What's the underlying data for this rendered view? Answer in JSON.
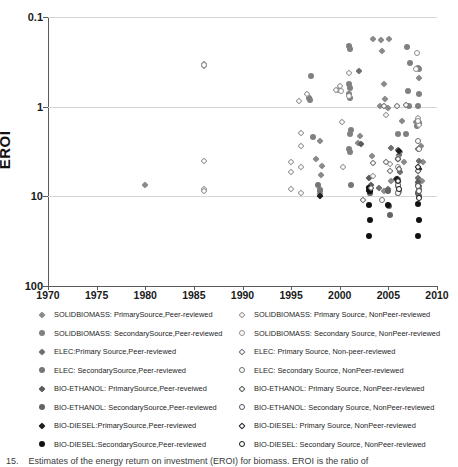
{
  "chart": {
    "type": "scatter",
    "title": "",
    "xlabel": "",
    "ylabel": "EROI",
    "xlim": [
      1970,
      2010
    ],
    "ylim": [
      0.1,
      100
    ],
    "yscale": "log",
    "grid": "horizontal",
    "legend_position": "below",
    "xticks": [
      "1970",
      "1975",
      "1980",
      "1985",
      "1990",
      "1995",
      "2000",
      "2005",
      "2010"
    ],
    "yticks": [
      "100",
      "10",
      "1",
      "0.1"
    ]
  },
  "chart_data": {
    "type": "scatter",
    "title": "",
    "xlabel": "",
    "ylabel": "EROI",
    "xlim": [
      1970,
      2010
    ],
    "ylim": [
      0.1,
      100
    ],
    "yscale": "log",
    "grid": "horizontal",
    "legend_position": "below",
    "xticks": [
      1970,
      1975,
      1980,
      1985,
      1990,
      1995,
      2000,
      2005,
      2010
    ],
    "yticks": [
      0.1,
      1,
      10,
      100
    ],
    "series": [
      {
        "name": "SOLIDBIOMASS: PrimarySource,Peer-reviewed",
        "marker": "diamond-filled",
        "color": "#8a8a8a",
        "points": [
          [
            1980,
            1.35
          ],
          [
            1998,
            4.1
          ],
          [
            1997.6,
            2.6
          ],
          [
            1998.2,
            2.2
          ],
          [
            1998.1,
            1.75
          ],
          [
            1998.0,
            1.2
          ],
          [
            1998.0,
            1.05
          ],
          [
            2002.1,
            4.75
          ],
          [
            2001.9,
            3.9
          ],
          [
            2003.3,
            2.85
          ],
          [
            2003.1,
            1.2
          ],
          [
            2004.6,
            1.15
          ],
          [
            2005.3,
            1.5
          ],
          [
            2003.4,
            57
          ],
          [
            2004.2,
            55
          ],
          [
            2005.1,
            57
          ],
          [
            2004.3,
            42
          ],
          [
            2004.5,
            18
          ],
          [
            2004.7,
            12.3
          ],
          [
            2005.0,
            9.6
          ],
          [
            2004.1,
            10.2
          ],
          [
            2006.4,
            7.0
          ],
          [
            2007.8,
            6.8
          ],
          [
            2008.2,
            21
          ],
          [
            2008.4,
            3.6
          ],
          [
            2008.6,
            2.4
          ],
          [
            2008.5,
            1.5
          ],
          [
            2006.2,
            3.1
          ],
          [
            2006.6,
            2.4
          ]
        ]
      },
      {
        "name": "SOLIDBIOMASS: SecondarySource,Peer-reviewed",
        "marker": "circle-filled",
        "color": "#808080",
        "points": [
          [
            1997.0,
            22
          ],
          [
            1996.8,
            12.5
          ],
          [
            1996.9,
            11.8
          ],
          [
            1997.2,
            4.6
          ],
          [
            1999.9,
            15.5
          ],
          [
            2001.0,
            47
          ],
          [
            2001.1,
            44
          ],
          [
            2001.0,
            18
          ],
          [
            2001.1,
            16
          ],
          [
            2001.0,
            14
          ],
          [
            2001.1,
            12.5
          ],
          [
            2001.2,
            5.5
          ],
          [
            2001.1,
            5.0
          ],
          [
            2001.0,
            3.4
          ],
          [
            2001.1,
            3.1
          ],
          [
            2006.9,
            46
          ],
          [
            2007.2,
            31
          ],
          [
            2007.0,
            15
          ],
          [
            2008.0,
            27
          ],
          [
            2008.1,
            26
          ],
          [
            2008.2,
            14
          ],
          [
            2008.0,
            10.3
          ],
          [
            2008.1,
            6.6
          ],
          [
            2007.9,
            6.1
          ],
          [
            2007.1,
            10.3
          ],
          [
            2006.0,
            5.0
          ],
          [
            2006.8,
            5.0
          ]
        ]
      },
      {
        "name": "ELEC:Primary Source,Peer-reviewed",
        "marker": "diamond-filled",
        "color": "#6e6e6e",
        "points": [
          [
            2002.0,
            25
          ],
          [
            2005.3,
            3.5
          ],
          [
            2006.0,
            3.3
          ],
          [
            2006.1,
            2.9
          ],
          [
            2006.2,
            1.85
          ],
          [
            2006.0,
            1.55
          ],
          [
            2008.0,
            3.4
          ],
          [
            2008.1,
            2.5
          ],
          [
            2008.0,
            1.6
          ],
          [
            2005.0,
            1.2
          ],
          [
            2004.0,
            1.25
          ]
        ]
      },
      {
        "name": "ELEC: SecondarySource,Peer-reviewed",
        "marker": "circle-filled",
        "color": "#767676",
        "points": [
          [
            1997.8,
            1.35
          ],
          [
            1998.0,
            1.15
          ],
          [
            2001.2,
            1.35
          ],
          [
            2003.0,
            1.2
          ],
          [
            2003.1,
            1.1
          ],
          [
            2006.0,
            1.3
          ],
          [
            2006.1,
            1.15
          ],
          [
            2008.0,
            1.35
          ],
          [
            2008.1,
            1.2
          ],
          [
            2008.0,
            1.1
          ]
        ]
      },
      {
        "name": "BIO-ETHANOL: PrimarySource,Peer-reveiwed",
        "marker": "diamond-filled",
        "color": "#5c5c5c",
        "points": [
          [
            2002.2,
            3.85
          ],
          [
            2003.0,
            1.6
          ],
          [
            2003.2,
            1.35
          ],
          [
            2005.8,
            1.55
          ],
          [
            2006.0,
            1.45
          ],
          [
            2008.0,
            1.45
          ],
          [
            2008.1,
            1.3
          ]
        ]
      },
      {
        "name": "BIO-ETHANOL: SecondarySource,Peer-reviewed",
        "marker": "circle-filled",
        "color": "#636363",
        "points": [
          [
            2003.0,
            1.25
          ],
          [
            2003.1,
            1.1
          ],
          [
            2005.0,
            1.15
          ],
          [
            2005.1,
            0.78
          ],
          [
            2005.2,
            0.62
          ],
          [
            2006.0,
            1.1
          ],
          [
            2008.0,
            1.1
          ],
          [
            2008.1,
            1.0
          ]
        ]
      },
      {
        "name": "BIO-DIESEL:PrimarySource,Peer-reviewed",
        "marker": "diamond-filled",
        "color": "#1f1f1f",
        "points": [
          [
            1998.0,
            1.0
          ],
          [
            2003.0,
            1.15
          ],
          [
            2005.9,
            1.55
          ],
          [
            2006.0,
            2.6
          ],
          [
            2006.1,
            3.2
          ],
          [
            2008.0,
            6.9
          ],
          [
            2008.1,
            2.0
          ]
        ]
      },
      {
        "name": "BIO-DIESEL:SecondarySource,Peer-reviewed",
        "marker": "circle-filled",
        "color": "#111111",
        "points": [
          [
            2003.0,
            1.25
          ],
          [
            2003.1,
            1.15
          ],
          [
            2003.0,
            0.8
          ],
          [
            2003.1,
            0.55
          ],
          [
            2003.0,
            0.36
          ],
          [
            2005.0,
            0.8
          ],
          [
            2008.0,
            0.82
          ],
          [
            2008.1,
            0.55
          ],
          [
            2008.0,
            0.36
          ]
        ]
      },
      {
        "name": "SOLIDBIOMASS: Primary Source, NonPeer-reviewed",
        "marker": "diamond-open",
        "color": "#9a9a9a",
        "points": [
          [
            1986.0,
            30
          ],
          [
            1986.0,
            28.5
          ],
          [
            1986.0,
            2.45
          ],
          [
            1986.0,
            1.22
          ],
          [
            1986.0,
            1.15
          ],
          [
            1995.0,
            2.4
          ],
          [
            1995.0,
            1.85
          ],
          [
            1995.0,
            1.2
          ],
          [
            1996.0,
            5.1
          ],
          [
            1996.0,
            3.6
          ],
          [
            1996.0,
            2.1
          ],
          [
            1996.0,
            1.1
          ],
          [
            1996.6,
            14
          ],
          [
            1995.8,
            11.5
          ],
          [
            1999.6,
            15.5
          ],
          [
            2000.0,
            17
          ],
          [
            2000.9,
            24
          ],
          [
            2000.2,
            6.7
          ],
          [
            2000.3,
            2.15
          ],
          [
            2003.4,
            1.7
          ],
          [
            2005.2,
            2.3
          ],
          [
            2006.0,
            2.7
          ],
          [
            2008.0,
            7.5
          ],
          [
            2008.1,
            6.2
          ],
          [
            2004.8,
            8.0
          ]
        ]
      },
      {
        "name": "SOLIDBIOMASS: Secondary Source, NonPeer-reviewed",
        "marker": "circle-open",
        "color": "#8e8e8e",
        "points": [
          [
            1986.0,
            29
          ],
          [
            2000.1,
            15
          ],
          [
            2001.0,
            13
          ],
          [
            2007.9,
            40
          ],
          [
            2007.8,
            26
          ],
          [
            2008.0,
            7.0
          ],
          [
            2006.0,
            2.1
          ]
        ]
      },
      {
        "name": "ELEC: Primary Source, Non-peer-reviewed",
        "marker": "diamond-open",
        "color": "#777777",
        "points": [
          [
            2004.6,
            10.3
          ],
          [
            2005.9,
            10.3
          ],
          [
            2006.8,
            10.4
          ],
          [
            2003.4,
            2.35
          ],
          [
            2004.8,
            2.4
          ],
          [
            2005.2,
            1.9
          ],
          [
            2002.4,
            0.92
          ]
        ]
      },
      {
        "name": "ELEC: Secondary Source, NonPeer-reviewed",
        "marker": "circle-open",
        "color": "#6f6f6f",
        "points": [
          [
            2008.0,
            4.1
          ],
          [
            2008.1,
            3.4
          ],
          [
            2004.3,
            0.9
          ],
          [
            2006.0,
            1.1
          ]
        ]
      },
      {
        "name": "BIO-ETHANOL: Primary Source, NonPeer-reviewed",
        "marker": "diamond-open",
        "color": "#5a5a5a",
        "points": [
          [
            2006.0,
            2.6
          ],
          [
            2006.1,
            2.0
          ],
          [
            2008.0,
            1.9
          ],
          [
            2003.2,
            1.25
          ]
        ]
      },
      {
        "name": "BIO-ETHANOL: Secondary Source, NonPeer-reviewed",
        "marker": "circle-open",
        "color": "#545454",
        "points": [
          [
            2006.0,
            1.35
          ],
          [
            2008.0,
            1.3
          ],
          [
            2008.1,
            1.15
          ]
        ]
      },
      {
        "name": "BIO-DIESEL: Primary Source, NonPeer-reviewed",
        "marker": "diamond-open",
        "color": "#222222",
        "points": [
          [
            2006.0,
            1.5
          ],
          [
            2008.0,
            2.1
          ]
        ]
      },
      {
        "name": "BIO-DIESEL: Secondary Source, NonPeer-reviewed",
        "marker": "circle-open",
        "color": "#161616",
        "points": [
          [
            2006.1,
            1.2
          ],
          [
            2008.1,
            0.95
          ]
        ]
      }
    ]
  },
  "legend": {
    "left_column": [
      {
        "label": "SOLIDBIOMASS: PrimarySource,Peer-reviewed",
        "marker": "diamond-filled",
        "color": "#8a8a8a"
      },
      {
        "label": "SOLIDBIOMASS: SecondarySource,Peer-reviewed",
        "marker": "circle-filled",
        "color": "#808080"
      },
      {
        "label": "ELEC:Primary Source,Peer-reviewed",
        "marker": "diamond-filled",
        "color": "#6e6e6e"
      },
      {
        "label": "ELEC: SecondarySource,Peer-reviewed",
        "marker": "circle-filled",
        "color": "#767676"
      },
      {
        "label": "BIO-ETHANOL: PrimarySource,Peer-reveiwed",
        "marker": "diamond-filled",
        "color": "#5c5c5c"
      },
      {
        "label": "BIO-ETHANOL: SecondarySource,Peer-reviewed",
        "marker": "circle-filled",
        "color": "#636363"
      },
      {
        "label": "BIO-DIESEL:PrimarySource,Peer-reviewed",
        "marker": "diamond-filled",
        "color": "#1f1f1f"
      },
      {
        "label": "BIO-DIESEL:SecondarySource,Peer-reviewed",
        "marker": "circle-filled",
        "color": "#111111"
      }
    ],
    "right_column": [
      {
        "label": "SOLIDBIOMASS: Primary Source, NonPeer-reviewed",
        "marker": "diamond-open",
        "color": "#9a9a9a"
      },
      {
        "label": "SOLIDBIOMASS: Secondary Source, NonPeer-reviewed",
        "marker": "circle-open",
        "color": "#8e8e8e"
      },
      {
        "label": "ELEC: Primary Source, Non-peer-reviewed",
        "marker": "diamond-open",
        "color": "#777777"
      },
      {
        "label": "ELEC: Secondary Source, NonPeer-reviewed",
        "marker": "circle-open",
        "color": "#6f6f6f"
      },
      {
        "label": "BIO-ETHANOL: Primary Source, NonPeer-reviewed",
        "marker": "diamond-open",
        "color": "#5a5a5a"
      },
      {
        "label": "BIO-ETHANOL: Secondary Source, NonPeer-reviewed",
        "marker": "circle-open",
        "color": "#545454"
      },
      {
        "label": "BIO-DIESEL: Primary Source, NonPeer-reviewed",
        "marker": "diamond-open",
        "color": "#222222"
      },
      {
        "label": "BIO-DIESEL: Secondary Source, NonPeer-reviewed",
        "marker": "circle-open",
        "color": "#161616"
      }
    ]
  },
  "caption": {
    "number": "15.",
    "text": "Estimates of the energy return on investment (EROI) for biomass. EROI is the ratio of"
  }
}
